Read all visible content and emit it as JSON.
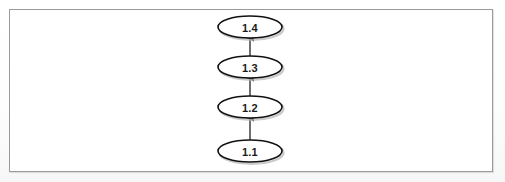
{
  "figure": {
    "kind": "flow-diagram",
    "orientation": "bottom-to-top",
    "background_color": "#ffffff",
    "frame_color": "#9a9a9a",
    "node_stroke_color": "#111111",
    "node_fill_color": "#ffffff",
    "edge_color": "#333333",
    "shadow_color": "#b8b8b8",
    "frame": {
      "x": 9,
      "y": 9,
      "width": 484,
      "height": 163
    },
    "nodes": [
      {
        "id": "n4",
        "label": "1.4",
        "shape": "ellipse",
        "cx": 250,
        "cy": 27,
        "rx": 32,
        "ry": 11
      },
      {
        "id": "n3",
        "label": "1.3",
        "shape": "ellipse",
        "cx": 250,
        "cy": 67,
        "rx": 32,
        "ry": 11
      },
      {
        "id": "n2",
        "label": "1.2",
        "shape": "ellipse",
        "cx": 250,
        "cy": 107,
        "rx": 32,
        "ry": 11
      },
      {
        "id": "n1",
        "label": "1.1",
        "shape": "ellipse",
        "cx": 250,
        "cy": 151,
        "rx": 32,
        "ry": 11
      }
    ],
    "edges": [
      {
        "id": "e1",
        "from": "n1",
        "to": "n2",
        "arrow": "up",
        "x": 250,
        "y1": 140,
        "y2": 118
      },
      {
        "id": "e2",
        "from": "n2",
        "to": "n3",
        "arrow": "up",
        "x": 250,
        "y1": 96,
        "y2": 78
      },
      {
        "id": "e3",
        "from": "n3",
        "to": "n4",
        "arrow": "up",
        "x": 250,
        "y1": 56,
        "y2": 38
      }
    ]
  }
}
